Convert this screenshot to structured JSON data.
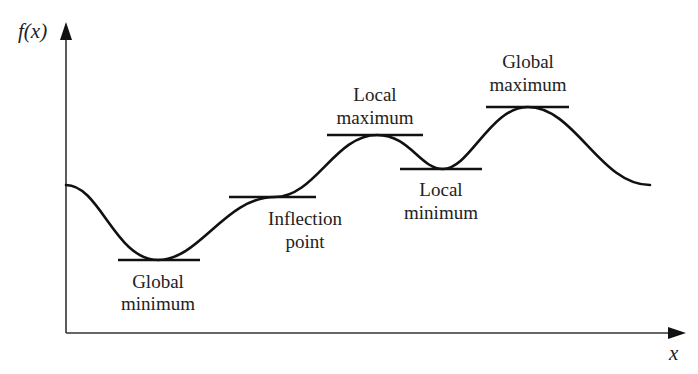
{
  "diagram": {
    "type": "function-extrema-illustration",
    "axes": {
      "y_label": "f(x)",
      "x_label": "x"
    },
    "points": [
      {
        "id": "global-minimum",
        "lines": [
          "Global",
          "minimum"
        ],
        "label_position": "below"
      },
      {
        "id": "inflection-point",
        "lines": [
          "Inflection",
          "point"
        ],
        "label_position": "below"
      },
      {
        "id": "local-maximum",
        "lines": [
          "Local",
          "maximum"
        ],
        "label_position": "above"
      },
      {
        "id": "local-minimum",
        "lines": [
          "Local",
          "minimum"
        ],
        "label_position": "below"
      },
      {
        "id": "global-maximum",
        "lines": [
          "Global",
          "maximum"
        ],
        "label_position": "above"
      }
    ],
    "colors": {
      "stroke": "#111111",
      "axis": "#333333",
      "background": "#ffffff"
    }
  }
}
